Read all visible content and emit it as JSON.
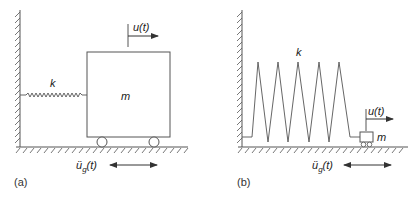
{
  "figure": {
    "panels": [
      {
        "id": "a",
        "caption": "(a)",
        "stiffness_label": "k",
        "mass_label": "m",
        "displacement_label": "u(t)",
        "ground_accel_label": "ü",
        "ground_accel_subscript": "g",
        "ground_accel_arg": "(t)",
        "description": "Rigid mass on rollers connected to wall by horizontal spring"
      },
      {
        "id": "b",
        "caption": "(b)",
        "stiffness_label": "k",
        "mass_label": "m",
        "displacement_label": "u(t)",
        "ground_accel_label": "ü",
        "ground_accel_subscript": "g",
        "ground_accel_arg": "(t)",
        "description": "Small mass on rollers connected to wall by large zigzag spring"
      }
    ],
    "colors": {
      "line": "#555555",
      "text": "#222222"
    }
  }
}
